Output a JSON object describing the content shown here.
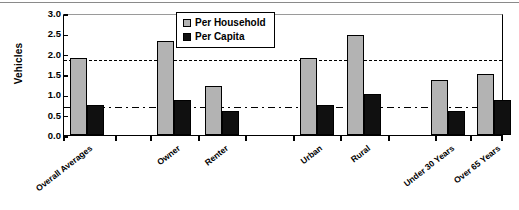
{
  "chart_data": {
    "type": "bar",
    "title": "",
    "xlabel": "",
    "ylabel": "Vehicles",
    "ylim": [
      0.0,
      3.0
    ],
    "ytick_labels": [
      "3.0",
      "2.5",
      "2.0",
      "1.5",
      "1.0",
      "0.5",
      "0.0"
    ],
    "ytick_values": [
      3.0,
      2.5,
      2.0,
      1.5,
      1.0,
      0.5,
      0.0
    ],
    "grid": false,
    "legend_position": "top-center",
    "categories": [
      "Overall Averages",
      "Owner",
      "Renter",
      "Urban",
      "Rural",
      "Under 30 Years",
      "Over 65 Years"
    ],
    "series": [
      {
        "name": "Per Household",
        "color": "#b3b3b3",
        "values": [
          1.9,
          2.3,
          1.2,
          1.9,
          2.45,
          1.35,
          1.5
        ]
      },
      {
        "name": "Per Capita",
        "color": "#101010",
        "values": [
          0.75,
          0.85,
          0.6,
          0.75,
          1.0,
          0.6,
          0.85
        ]
      }
    ],
    "reference_lines": [
      {
        "name": "overall-per-household-reference",
        "value": 1.9,
        "style": "dashed"
      },
      {
        "name": "overall-per-capita-reference",
        "value": 0.75,
        "style": "dash-dot"
      }
    ],
    "annotations": []
  },
  "legend": {
    "items": [
      {
        "label": "Per Household",
        "swatch": "household-swatch"
      },
      {
        "label": "Per Capita",
        "swatch": "capita-swatch"
      }
    ]
  }
}
